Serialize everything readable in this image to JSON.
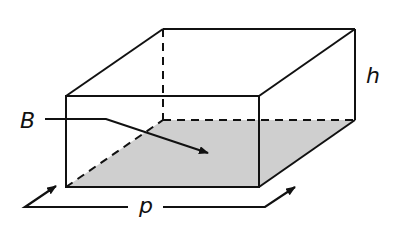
{
  "diagram": {
    "type": "rectangular-prism",
    "labels": {
      "base": "B",
      "height": "h",
      "perimeter": "p"
    },
    "colors": {
      "stroke": "#111111",
      "base_fill": "#cfcfcf",
      "background": "#ffffff"
    }
  }
}
